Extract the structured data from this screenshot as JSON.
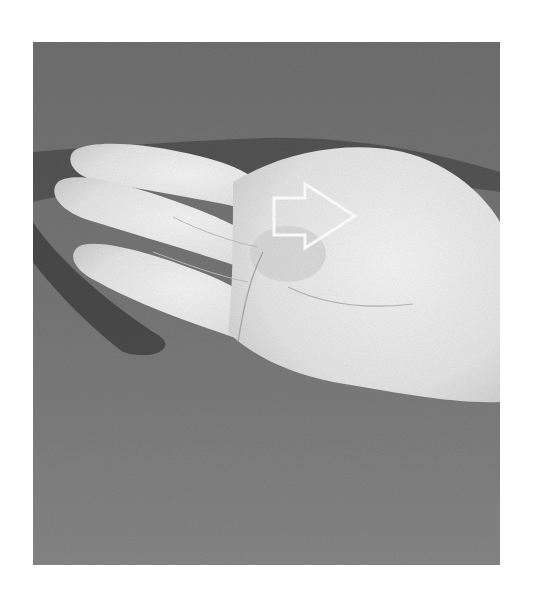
{
  "image": {
    "alt": "Grayscale photograph of an open hand palm-up with a white outlined arrow pointing right over the thenar area",
    "background_color": "#ffffff",
    "backdrop_color": "#7a7a7a",
    "skin_color": "#e6e6e6",
    "arrow": {
      "direction": "right",
      "stroke_color": "#ffffff",
      "fill": "none"
    }
  }
}
